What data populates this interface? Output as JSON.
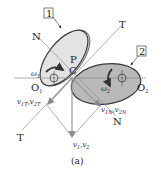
{
  "figure": {
    "caption": "(a)",
    "colors": {
      "body1_fill": "#e3e3e3",
      "body1_back": "#d6d6d6",
      "body2_fill": "#b9b9b9",
      "outline": "#3a3a3a",
      "line": "#8a8a8a",
      "vector": "#9a9a9a",
      "text": "#222222"
    },
    "bodies": [
      {
        "id": "1",
        "label": "1",
        "pivot": "O₁",
        "omega": "ω₁"
      },
      {
        "id": "2",
        "label": "2",
        "pivot": "O₂",
        "omega": "ω₂"
      }
    ],
    "points": {
      "contact_P": "P",
      "contact_C": "C",
      "pivot_1": "O",
      "pivot_1_sub": "1",
      "pivot_2": "O",
      "pivot_2_sub": "2"
    },
    "lines": {
      "normal_top": "N",
      "normal_bottom": "N",
      "tangent_top": "T",
      "tangent_bottom": "T"
    },
    "angular_velocity": {
      "omega1": "ω",
      "omega1_sub": "1",
      "omega2": "ω",
      "omega2_sub": "2"
    },
    "vectors": {
      "tangential": {
        "a": "v",
        "a_sub": "1T",
        "sep": ",",
        "b": "v",
        "b_sub": "2T"
      },
      "normal": {
        "a": "v",
        "a_sub": "1N",
        "sep": ",",
        "b": "v",
        "b_sub": "2N"
      },
      "resultant": {
        "a": "v",
        "a_sub": "1",
        "sep": ",",
        "b": "v",
        "b_sub": "2"
      }
    }
  }
}
